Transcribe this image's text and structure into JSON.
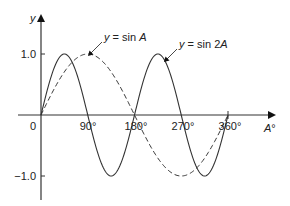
{
  "chart_data": {
    "type": "line",
    "title": "",
    "xlabel": "A°",
    "ylabel": "y",
    "xlim": [
      0,
      360
    ],
    "ylim": [
      -1.0,
      1.0
    ],
    "x_ticks": [
      "90°",
      "180°",
      "270°",
      "360°"
    ],
    "x_origin_label": "0",
    "y_ticks": [
      "1.0",
      "−1.0"
    ],
    "grid": false,
    "legend": "inline annotations with leader arrows",
    "x": [
      0,
      45,
      90,
      135,
      180,
      225,
      270,
      315,
      360
    ],
    "series": [
      {
        "name": "y = sin A",
        "style": "dashed",
        "values": [
          0,
          0.707,
          1,
          0.707,
          0,
          -0.707,
          -1,
          -0.707,
          0
        ]
      },
      {
        "name": "y = sin 2A",
        "style": "solid",
        "values": [
          0,
          1,
          0,
          -1,
          0,
          1,
          0,
          -1,
          0
        ]
      }
    ],
    "annotations": [
      {
        "text_parts": [
          "y",
          " = sin ",
          "A"
        ],
        "target": "y = sin A"
      },
      {
        "text_parts": [
          "y",
          " = sin 2",
          "A"
        ],
        "target": "y = sin 2A"
      }
    ]
  },
  "axis": {
    "y_label": "y",
    "x_label_var": "A",
    "x_label_unit": "°",
    "origin": "0",
    "xt90": "90°",
    "xt180": "180°",
    "xt270": "270°",
    "xt360": "360°",
    "yt1": "1.0",
    "ytm1": "−1.0"
  },
  "labels": {
    "sinA_y": "y",
    "sinA_eq": " = sin ",
    "sinA_A": "A",
    "sin2A_y": "y",
    "sin2A_eq": " = sin 2",
    "sin2A_A": "A"
  }
}
